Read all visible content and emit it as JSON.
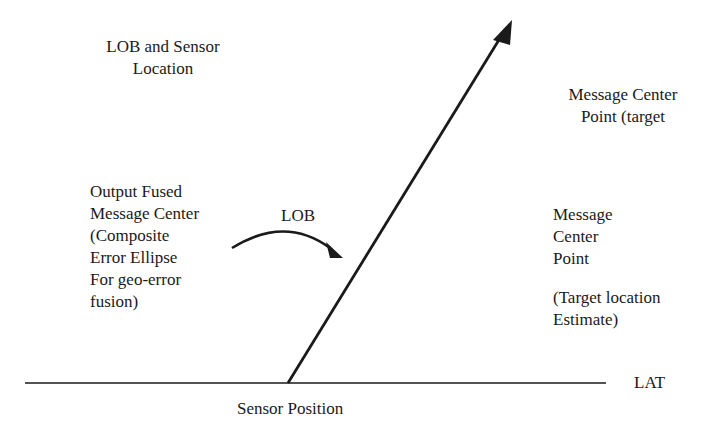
{
  "diagram": {
    "labels": {
      "lob_sensor_location": "LOB and Sensor\nLocation",
      "output_fused": "Output Fused\nMessage Center\n(Composite\nError Ellipse\nFor geo-error\nfusion)",
      "lob": "LOB",
      "message_center_target": "Message Center\nPoint (target",
      "message_center_point": "Message\nCenter\nPoint",
      "target_location_estimate": "(Target location\nEstimate)",
      "lat": "LAT",
      "sensor_position": "Sensor Position"
    },
    "colors": {
      "ink": "#1a1a1a",
      "background": "#ffffff"
    }
  }
}
